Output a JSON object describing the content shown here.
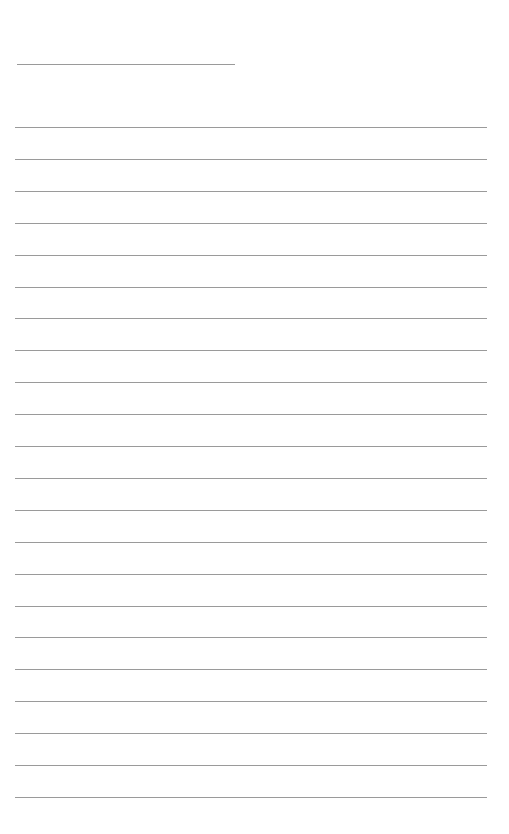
{
  "page": {
    "type": "lined-paper",
    "header_line": {
      "top": 64,
      "left": 17,
      "width": 218
    },
    "rules": {
      "count": 22,
      "first_top": 127,
      "spacing": 31.9,
      "left": 15,
      "width": 472
    },
    "line_color": "#9a9a9a",
    "background": "#ffffff"
  }
}
